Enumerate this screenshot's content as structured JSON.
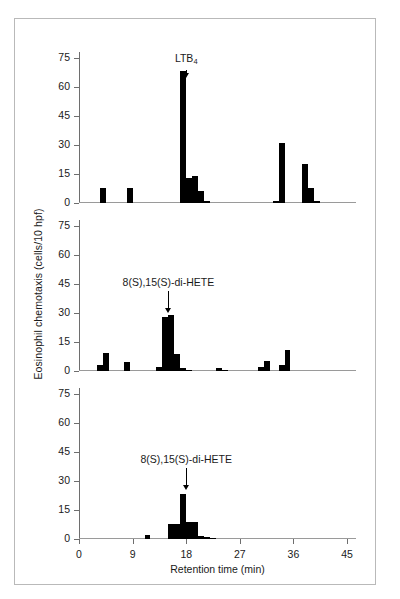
{
  "figure": {
    "y_axis_title": "Eosinophil chemotaxis (cells/10 hpf)",
    "x_axis_title": "Retention time (min)",
    "bar_color": "#000000",
    "axis_color": "#6e6e6e",
    "frame_color": "#b9b9b9"
  },
  "axes": {
    "y_ticks": [
      0,
      15,
      30,
      45,
      60,
      75
    ],
    "y_tick_labels": [
      "0",
      "15",
      "30",
      "45",
      "60",
      "75"
    ],
    "ylim": [
      0,
      78
    ],
    "x_ticks": [
      0,
      9,
      18,
      27,
      36,
      45
    ],
    "x_tick_labels": [
      "0",
      "9",
      "18",
      "27",
      "36",
      "45"
    ],
    "xlim": [
      0,
      46.5
    ]
  },
  "annotations": {
    "ltb4": {
      "label_main": "LTB",
      "label_sub": "4",
      "retention_time": 18
    },
    "dihete": {
      "label": "8(S),15(S)-di-HETE",
      "retention_time": 15
    }
  },
  "chart_data": [
    {
      "type": "bar",
      "panel": "top",
      "title": "",
      "xlabel": "",
      "ylabel": "Eosinophil chemotaxis (cells/10 hpf)",
      "xlim": [
        0,
        46.5
      ],
      "ylim": [
        0,
        78
      ],
      "grid": false,
      "legend": "none",
      "annotation": "LTB4",
      "annotation_x": 18,
      "bar_width": 1,
      "x": [
        4,
        8.5,
        17.5,
        18.5,
        19.5,
        20.5,
        21.5,
        33,
        34,
        38,
        39,
        40
      ],
      "values": [
        7.5,
        8,
        68,
        13,
        14,
        6,
        1,
        1,
        31,
        20,
        8,
        1
      ]
    },
    {
      "type": "bar",
      "panel": "middle",
      "title": "",
      "xlabel": "",
      "ylabel": "Eosinophil chemotaxis (cells/10 hpf)",
      "xlim": [
        0,
        46.5
      ],
      "ylim": [
        0,
        78
      ],
      "grid": false,
      "legend": "none",
      "annotation": "8(S),15(S)-di-HETE",
      "annotation_x": 15,
      "bar_width": 1,
      "x": [
        3.5,
        4.5,
        8,
        13.5,
        14.5,
        15.5,
        16.5,
        17.5,
        18.5,
        23.5,
        24.5,
        30.5,
        31.5,
        34,
        35
      ],
      "values": [
        3,
        9.5,
        4.5,
        2,
        28,
        29,
        9,
        1.5,
        0.5,
        1.5,
        0.5,
        2,
        5,
        3,
        11
      ]
    },
    {
      "type": "bar",
      "panel": "bottom",
      "title": "",
      "xlabel": "Retention time (min)",
      "ylabel": "Eosinophil chemotaxis (cells/10 hpf)",
      "xlim": [
        0,
        46.5
      ],
      "ylim": [
        0,
        78
      ],
      "grid": false,
      "legend": "none",
      "annotation": "8(S),15(S)-di-HETE",
      "annotation_x": 18,
      "bar_width": 1,
      "x": [
        11.5,
        15.5,
        16.5,
        17.5,
        18.5,
        19.5,
        20.5,
        21.5,
        22.5
      ],
      "values": [
        2,
        8,
        8,
        23,
        9,
        9,
        1.5,
        1,
        0.5
      ]
    }
  ]
}
